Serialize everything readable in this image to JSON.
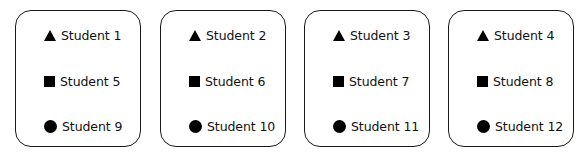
{
  "groups": [
    {
      "items": [
        {
          "shape": "triangle",
          "label": "Student 1"
        },
        {
          "shape": "square",
          "label": "Student 5"
        },
        {
          "shape": "circle",
          "label": "Student 9"
        }
      ]
    },
    {
      "items": [
        {
          "shape": "triangle",
          "label": "Student 2"
        },
        {
          "shape": "square",
          "label": "Student 6"
        },
        {
          "shape": "circle",
          "label": "Student 10"
        }
      ]
    },
    {
      "items": [
        {
          "shape": "triangle",
          "label": "Student 3"
        },
        {
          "shape": "square",
          "label": "Student 7"
        },
        {
          "shape": "circle",
          "label": "Student 11"
        }
      ]
    },
    {
      "items": [
        {
          "shape": "triangle",
          "label": "Student 4"
        },
        {
          "shape": "square",
          "label": "Student 8"
        },
        {
          "shape": "circle",
          "label": "Student 12"
        }
      ]
    }
  ]
}
